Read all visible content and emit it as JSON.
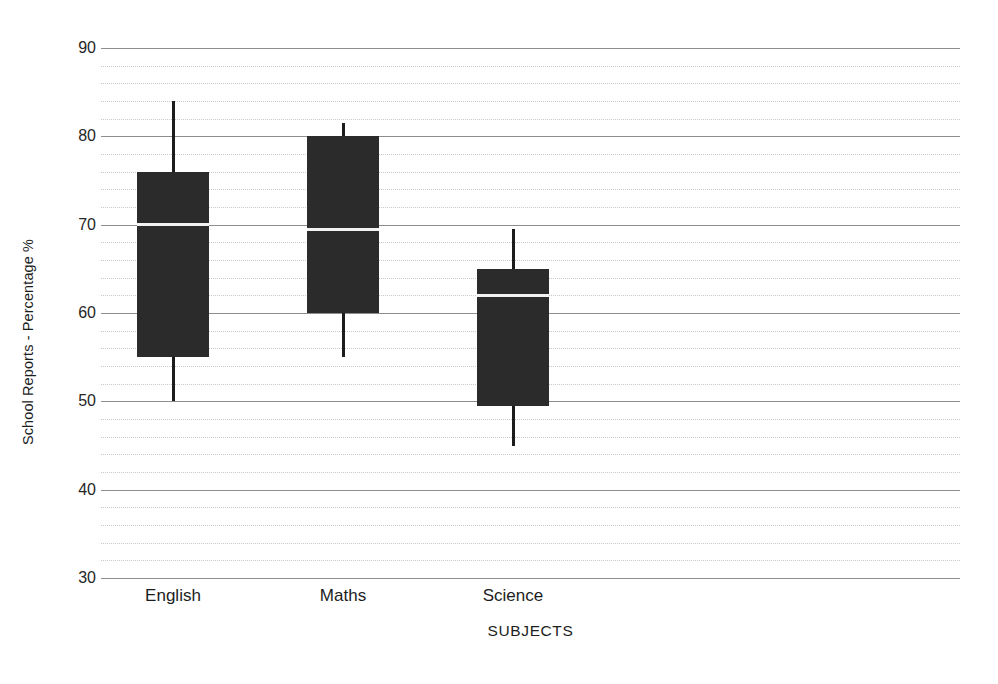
{
  "chart_data": {
    "type": "box",
    "title": "",
    "xlabel": "SUBJECTS",
    "ylabel": "School Reports - Percentage %",
    "categories": [
      "English",
      "Maths",
      "Science"
    ],
    "ylim": [
      30,
      90
    ],
    "y_major_ticks": [
      30,
      40,
      50,
      60,
      70,
      80,
      90
    ],
    "y_tick_labels": [
      "30",
      "40",
      "50",
      "60",
      "70",
      "80",
      "90"
    ],
    "y_minor_step": 2,
    "grid": true,
    "legend": "none",
    "box_color": "#2b2b2b",
    "median_color": "#f2f2f2",
    "whisker_color": "#1c1c1c",
    "major_grid_color": "#8d8d8d",
    "minor_grid_color": "#c9c9c9",
    "boxes": [
      {
        "category": "English",
        "whisker_low": 50,
        "q1": 55,
        "median": 70,
        "q3": 76,
        "whisker_high": 84
      },
      {
        "category": "Maths",
        "whisker_low": 55,
        "q1": 60,
        "median": 69.5,
        "q3": 80,
        "whisker_high": 81.5
      },
      {
        "category": "Science",
        "whisker_low": 45,
        "q1": 49.5,
        "median": 62,
        "q3": 65,
        "whisker_high": 69.5
      }
    ]
  }
}
